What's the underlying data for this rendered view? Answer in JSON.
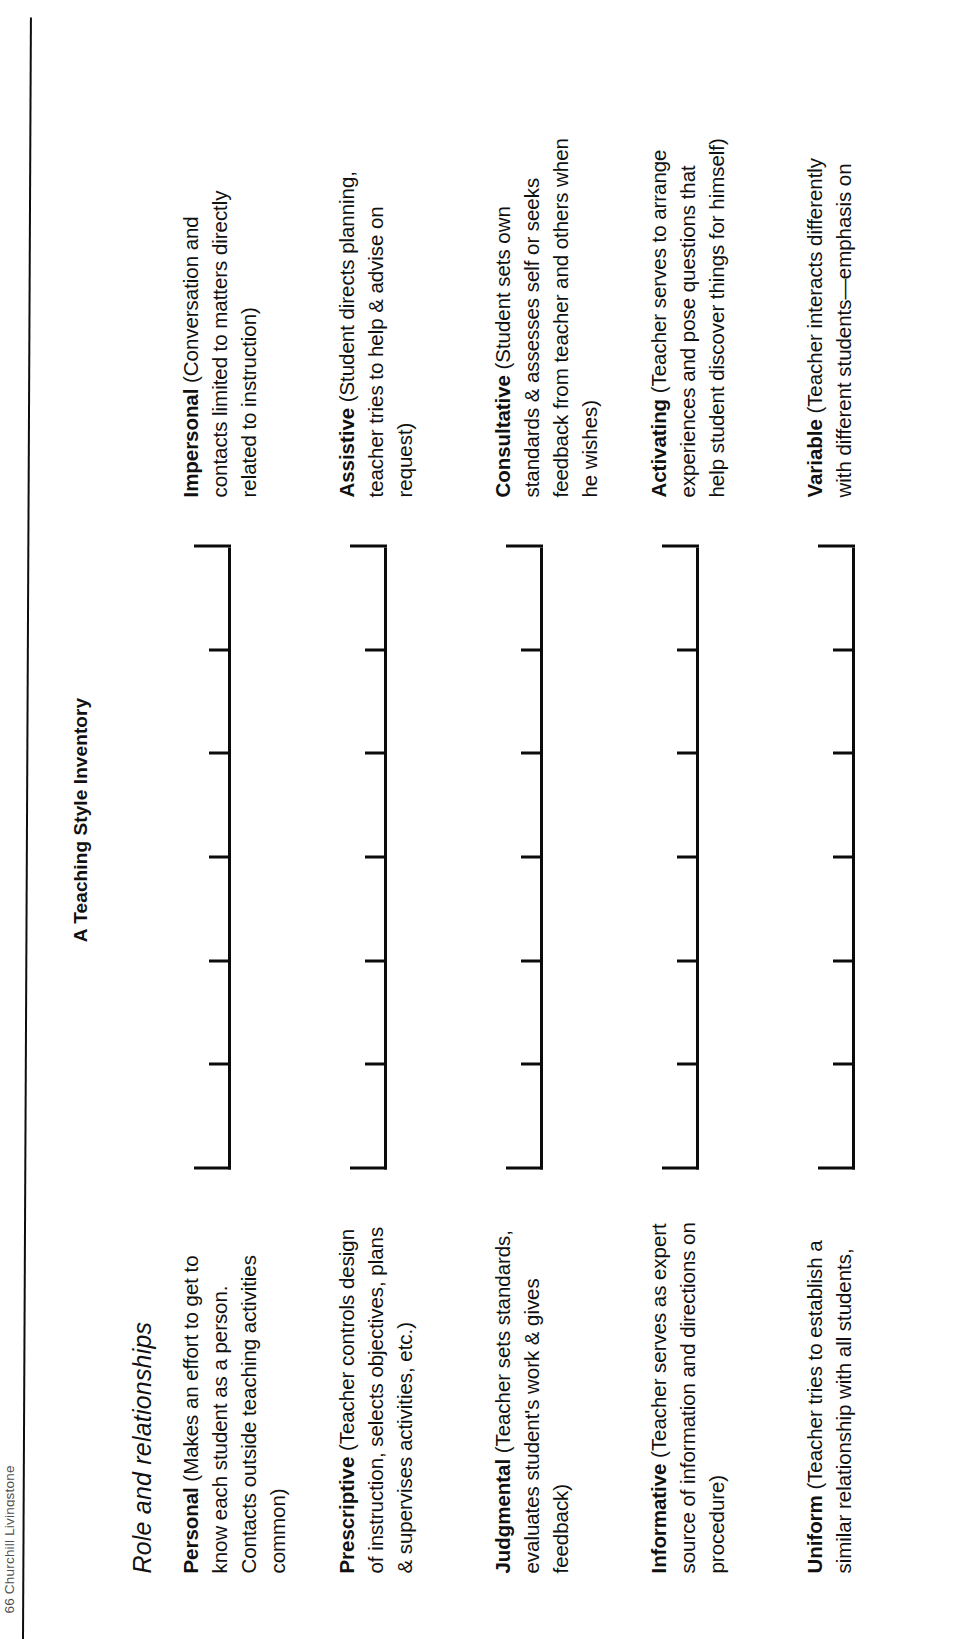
{
  "running_head": "66 Churchill Livingstone",
  "title": "A Teaching Style Inventory",
  "section": {
    "heading": "Role and relationships"
  },
  "scale": {
    "points": 7,
    "tick_labels": [
      "",
      "",
      "",
      "",
      "",
      "",
      ""
    ],
    "end_cap_style": "bracket"
  },
  "rows": [
    {
      "left": {
        "term": "Personal",
        "description": "(Makes an effort to get to know each student as a person. Contacts outside teaching activities common)"
      },
      "right": {
        "term": "Impersonal",
        "description": "(Conversation and contacts limited to matters directly related to instruction)"
      }
    },
    {
      "left": {
        "term": "Prescriptive",
        "description": "(Teacher controls design of instruction, selects objectives, plans & supervises activities, etc.)"
      },
      "right": {
        "term": "Assistive",
        "description": "(Student directs planning, teacher tries to help & advise on request)"
      }
    },
    {
      "left": {
        "term": "Judgmental",
        "description": "(Teacher sets standards, evaluates student's work & gives feedback)"
      },
      "right": {
        "term": "Consultative",
        "description": "(Student sets own standards & assesses self or seeks feedback from teacher and others when he wishes)"
      }
    },
    {
      "left": {
        "term": "Informative",
        "description": "(Teacher serves as expert source of information and directions on procedure)"
      },
      "right": {
        "term": "Activating",
        "description": "(Teacher serves to arrange experiences and pose questions that help student discover things for himself)"
      }
    },
    {
      "left": {
        "term": "Uniform",
        "description": "(Teacher tries to establish a similar relationship with all students,"
      },
      "right": {
        "term": "Variable",
        "description": "(Teacher interacts differently with different students—emphasis on"
      }
    }
  ],
  "colors": {
    "ink": "#111111",
    "rule": "#0d0d0d",
    "paper": "#ffffff"
  }
}
